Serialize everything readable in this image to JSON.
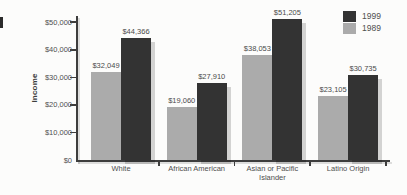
{
  "figure": {
    "background": "#fcfcfb"
  },
  "chart_data": {
    "type": "bar",
    "title": "",
    "xlabel": "",
    "ylabel": "Income",
    "categories": [
      "White",
      "African American",
      "Asian or Pacific\nIslander",
      "Latino Origin"
    ],
    "series": [
      {
        "name": "1989",
        "color": "#ababab",
        "values": [
          32049,
          19060,
          38053,
          23105
        ],
        "value_labels": [
          "$32,049",
          "$19,060",
          "$38,053",
          "$23,105"
        ]
      },
      {
        "name": "1999",
        "color": "#333333",
        "values": [
          44366,
          27910,
          51205,
          30735
        ],
        "value_labels": [
          "$44,366",
          "$27,910",
          "$51,205",
          "$30,735"
        ]
      }
    ],
    "y_ticks": [
      0,
      10000,
      20000,
      30000,
      40000,
      50000
    ],
    "y_tick_labels": [
      "$0",
      "$10,000",
      "$20,000",
      "$30,000",
      "$40,000",
      "$50,000"
    ],
    "ylim": [
      0,
      52500
    ],
    "grid": false,
    "legend": {
      "position": "top-right",
      "entries": [
        {
          "label": "1999",
          "color": "#333333"
        },
        {
          "label": "1989",
          "color": "#ababab"
        }
      ]
    }
  }
}
